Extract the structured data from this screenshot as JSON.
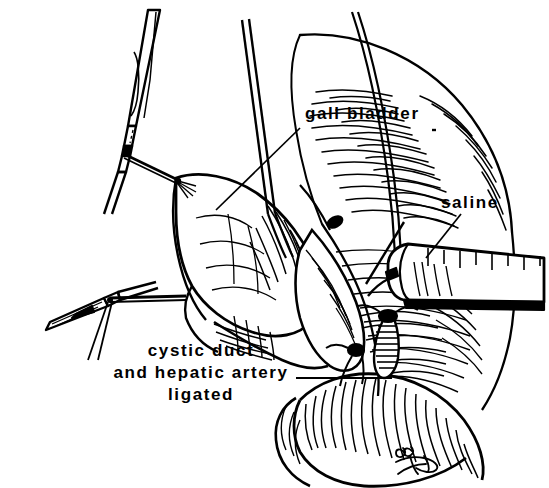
{
  "figure": {
    "domain": "medical-surgical-illustration",
    "style": "black-and-white pen-and-ink line art",
    "background_color": "#ffffff",
    "ink_color": "#000000",
    "width": 549,
    "height": 488
  },
  "labels": {
    "gall_bladder": "gall bladder",
    "saline": "saline",
    "ligated_line_1": "cystic duct",
    "ligated_line_2": "and hepatic artery",
    "ligated_line_3": "ligated"
  },
  "leaders": {
    "gall_bladder_leader": "line from label down-left to gallbladder surface",
    "saline_leader": "line from label down-left to syringe barrel",
    "ligated_leader": "horizontal line from label right to ligated duct stumps"
  },
  "anatomy": [
    {
      "name": "gall-bladder",
      "description": "pouch-shaped organ held at left of field"
    },
    {
      "name": "liver",
      "description": "large hatched mass across upper right"
    },
    {
      "name": "cystic-duct-stump",
      "description": "ligated stump with suture knot"
    },
    {
      "name": "hepatic-artery-stump",
      "description": "second ligated stump with knot"
    },
    {
      "name": "duodenum",
      "description": "looping bowel coil at lower center-right"
    }
  ],
  "instruments": [
    {
      "name": "upper-forceps",
      "description": "long clamp entering from top left holding tissue"
    },
    {
      "name": "lower-forceps",
      "description": "clamp entering from lower left"
    },
    {
      "name": "retractor-suture",
      "description": "paired thin traction threads from top center"
    },
    {
      "name": "syringe",
      "description": "graduated syringe barrel entering from right with needle"
    }
  ],
  "signature": {
    "text": "88",
    "description": "artist monogram and year at lower right"
  }
}
